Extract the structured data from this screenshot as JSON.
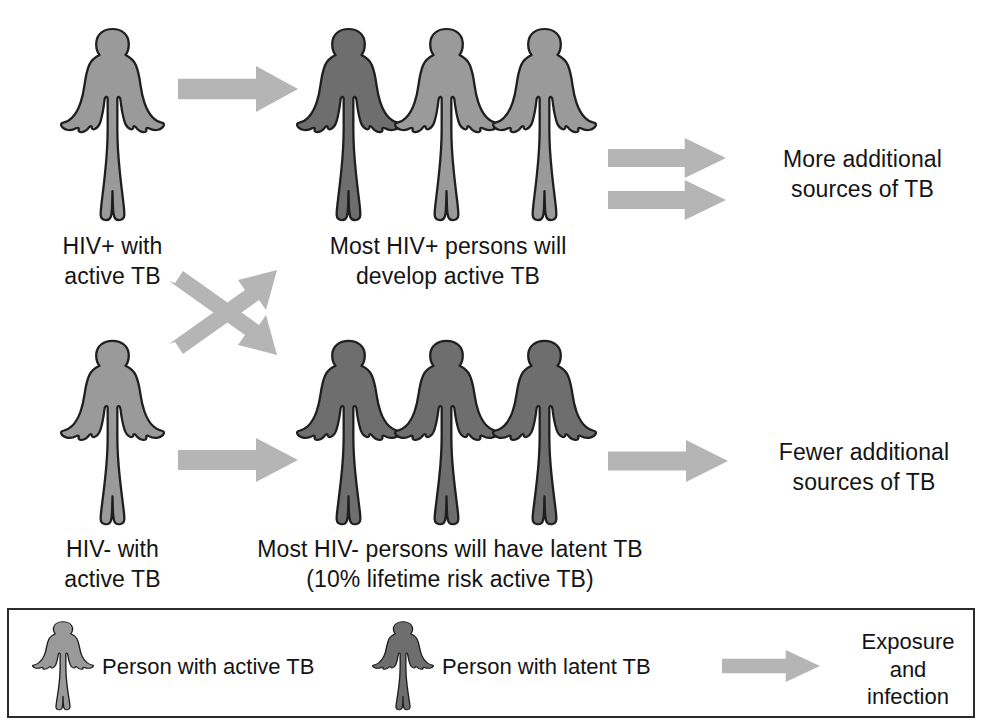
{
  "figure": {
    "colors": {
      "active_tb_fill": "#9a9a9a",
      "latent_tb_fill": "#6e6e6e",
      "outline": "#1f1f1f",
      "arrow_fill": "#b5b5b5",
      "background": "#ffffff",
      "text": "#141414",
      "legend_border": "#2b2b2b"
    }
  },
  "rows": {
    "top": {
      "source_label": "HIV+ with\nactive TB",
      "source_person_state": "active",
      "outcome_label": "Most HIV+ persons will\ndevelop active TB",
      "outcome_person_states": [
        "latent",
        "active",
        "active"
      ],
      "result_label": "More additional\nsources of TB",
      "result_arrow_count": 2
    },
    "bottom": {
      "source_label": "HIV- with\nactive TB",
      "source_person_state": "active",
      "outcome_label": "Most HIV- persons will have latent TB\n(10% lifetime risk active TB)",
      "outcome_person_states": [
        "latent",
        "latent",
        "latent"
      ],
      "result_label": "Fewer additional\nsources of TB",
      "result_arrow_count": 1
    }
  },
  "cross_arrows": {
    "name": "crossing-exposure-arrows",
    "count": 2,
    "directions": [
      "up-right",
      "down-right"
    ]
  },
  "legend": {
    "items": [
      {
        "icon": "person-active-tb-icon",
        "state": "active",
        "label": "Person with active TB"
      },
      {
        "icon": "person-latent-tb-icon",
        "state": "latent",
        "label": "Person with latent TB"
      },
      {
        "icon": "arrow-right-icon",
        "state": "arrow",
        "label": "Exposure\nand\ninfection"
      }
    ]
  }
}
